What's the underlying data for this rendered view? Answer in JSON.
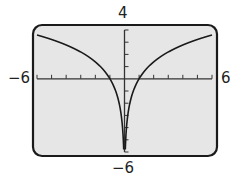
{
  "window": {
    "x_min_label": "−6",
    "x_max_label": "6",
    "y_max_label": "4",
    "y_min_label": "−6"
  },
  "colors": {
    "screen_bg": "#e6e6e6",
    "frame": "#1a1a1a",
    "axis": "#333333",
    "curve": "#1a1a1a"
  },
  "chart_data": {
    "type": "line",
    "title": "",
    "function": "y = ln(x^2)",
    "xlabel": "",
    "ylabel": "",
    "xlim": [
      -6,
      6
    ],
    "ylim": [
      -6,
      4
    ],
    "xscale_ticks": 1,
    "yscale_ticks": 1,
    "grid": false,
    "legend": null,
    "series": [
      {
        "name": "left branch",
        "x": [
          -6,
          -5,
          -4,
          -3,
          -2,
          -1,
          -0.5,
          -0.2,
          -0.06
        ],
        "y": [
          3.58,
          3.22,
          2.77,
          2.2,
          1.39,
          0,
          -1.39,
          -3.22,
          -5.63
        ]
      },
      {
        "name": "right branch",
        "x": [
          0.06,
          0.2,
          0.5,
          1,
          2,
          3,
          4,
          5,
          6
        ],
        "y": [
          -5.63,
          -3.22,
          -1.39,
          0,
          1.39,
          2.2,
          2.77,
          3.22,
          3.58
        ]
      }
    ],
    "x_intercepts": [
      -1,
      1
    ],
    "vertical_asymptote": 0
  }
}
